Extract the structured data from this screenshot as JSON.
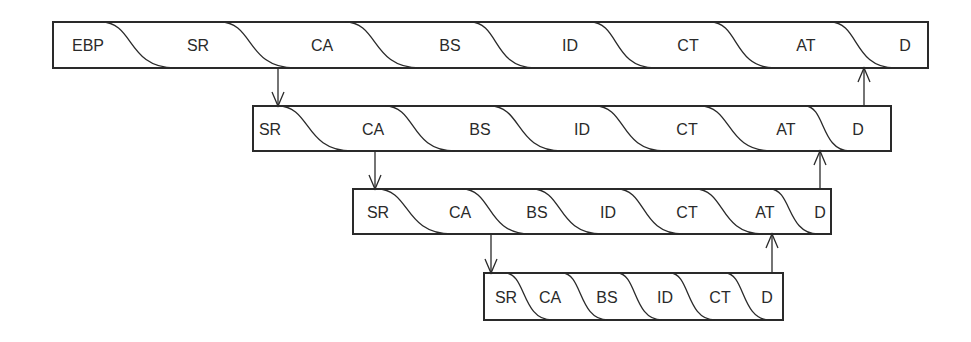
{
  "diagram": {
    "type": "nested-pipeline",
    "colors": {
      "stroke": "#2a2a2a",
      "background": "#ffffff",
      "text": "#2a2a2a"
    },
    "levels": [
      {
        "id": "level-1",
        "box": {
          "x": 53,
          "y": 22,
          "w": 875,
          "h": 46
        },
        "stages": [
          {
            "label": "EBP",
            "x": 88
          },
          {
            "label": "SR",
            "x": 198
          },
          {
            "label": "CA",
            "x": 322
          },
          {
            "label": "BS",
            "x": 450
          },
          {
            "label": "ID",
            "x": 570
          },
          {
            "label": "CT",
            "x": 688
          },
          {
            "label": "AT",
            "x": 806
          },
          {
            "label": "D",
            "x": 905
          }
        ],
        "seams": [
          [
            101,
            175
          ],
          [
            220,
            295
          ],
          [
            345,
            420
          ],
          [
            470,
            535
          ],
          [
            590,
            655
          ],
          [
            710,
            775
          ],
          [
            830,
            895
          ]
        ]
      },
      {
        "id": "level-2",
        "box": {
          "x": 253,
          "y": 106,
          "w": 638,
          "h": 45
        },
        "stages": [
          {
            "label": "SR",
            "x": 270
          },
          {
            "label": "CA",
            "x": 373
          },
          {
            "label": "BS",
            "x": 480
          },
          {
            "label": "ID",
            "x": 582
          },
          {
            "label": "CT",
            "x": 687
          },
          {
            "label": "AT",
            "x": 786
          },
          {
            "label": "D",
            "x": 858
          }
        ],
        "seams": [
          [
            278,
            352
          ],
          [
            385,
            455
          ],
          [
            490,
            562
          ],
          [
            595,
            665
          ],
          [
            700,
            772
          ],
          [
            805,
            850
          ]
        ]
      },
      {
        "id": "level-3",
        "box": {
          "x": 353,
          "y": 189,
          "w": 478,
          "h": 45
        },
        "stages": [
          {
            "label": "SR",
            "x": 378
          },
          {
            "label": "CA",
            "x": 460
          },
          {
            "label": "BS",
            "x": 537
          },
          {
            "label": "ID",
            "x": 608
          },
          {
            "label": "CT",
            "x": 687
          },
          {
            "label": "AT",
            "x": 765
          },
          {
            "label": "D",
            "x": 820
          }
        ],
        "seams": [
          [
            377,
            452
          ],
          [
            462,
            530
          ],
          [
            532,
            602
          ],
          [
            617,
            683
          ],
          [
            695,
            763
          ],
          [
            770,
            818
          ]
        ]
      },
      {
        "id": "level-4",
        "box": {
          "x": 484,
          "y": 273,
          "w": 299,
          "h": 47
        },
        "stages": [
          {
            "label": "SR",
            "x": 506
          },
          {
            "label": "CA",
            "x": 550
          },
          {
            "label": "BS",
            "x": 607
          },
          {
            "label": "ID",
            "x": 665
          },
          {
            "label": "CT",
            "x": 720
          },
          {
            "label": "D",
            "x": 767
          }
        ],
        "seams": [
          [
            505,
            552
          ],
          [
            562,
            608
          ],
          [
            617,
            662
          ],
          [
            670,
            715
          ],
          [
            725,
            770
          ]
        ]
      }
    ],
    "arrows": [
      {
        "dir": "down",
        "x": 278,
        "y1": 68,
        "y2": 106
      },
      {
        "dir": "up",
        "x": 864,
        "y1": 106,
        "y2": 68
      },
      {
        "dir": "down",
        "x": 375,
        "y1": 151,
        "y2": 189
      },
      {
        "dir": "up",
        "x": 820,
        "y1": 189,
        "y2": 151
      },
      {
        "dir": "down",
        "x": 491,
        "y1": 234,
        "y2": 273
      },
      {
        "dir": "up",
        "x": 772,
        "y1": 273,
        "y2": 234
      }
    ]
  }
}
